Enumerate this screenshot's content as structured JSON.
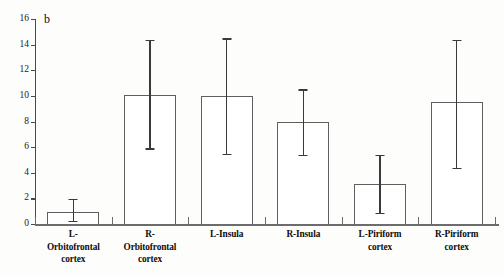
{
  "panel": {
    "label": "b"
  },
  "chart_data": {
    "type": "bar",
    "title": "",
    "subtitle": "",
    "xlabel": "",
    "ylabel": "Activation (% change x no. of pixels)",
    "ylim": [
      0,
      16
    ],
    "yticks": [
      0,
      2,
      4,
      6,
      8,
      10,
      12,
      14,
      16
    ],
    "ytick_labels": [
      "0",
      "2",
      "4",
      "6",
      "8",
      "10",
      "12",
      "14",
      "16"
    ],
    "grid": false,
    "legend": null,
    "categories": [
      "L-\nOrbitofrontal\ncortex",
      "R-\nOrbitofrontal\ncortex",
      "L-Insula",
      "R-Insula",
      "L-Piriform\ncortex",
      "R-Piriform\ncortex"
    ],
    "values": [
      0.9,
      10.1,
      10.0,
      8.0,
      3.1,
      9.5
    ],
    "error_upper": [
      1.95,
      14.4,
      14.5,
      10.5,
      5.4,
      14.4
    ],
    "error_lower": [
      0.25,
      5.9,
      5.5,
      5.4,
      0.85,
      4.4
    ],
    "bar_face_color": "#ffffff",
    "bar_edge_color": "#5f5f5f",
    "error_color": "#3a3a3a",
    "axis_color": "#4a4a4a"
  },
  "categories_display": [
    {
      "line1": "L-",
      "line2": "Orbitofrontal",
      "line3": "cortex"
    },
    {
      "line1": "R-",
      "line2": "Orbitofrontal",
      "line3": "cortex"
    },
    {
      "line1": "L-Insula",
      "line2": "",
      "line3": ""
    },
    {
      "line1": "R-Insula",
      "line2": "",
      "line3": ""
    },
    {
      "line1": "L-Piriform",
      "line2": "cortex",
      "line3": ""
    },
    {
      "line1": "R-Piriform",
      "line2": "cortex",
      "line3": ""
    }
  ]
}
